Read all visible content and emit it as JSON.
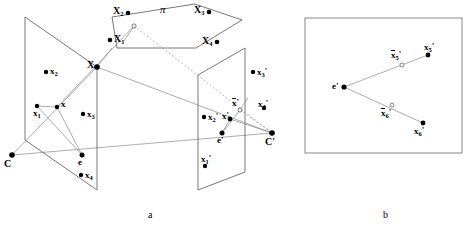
{
  "figure": {
    "panels": [
      {
        "id": "a",
        "label": "a",
        "x": 148,
        "y": 210
      },
      {
        "id": "b",
        "label": "b",
        "x": 383,
        "y": 210
      }
    ]
  },
  "panel_a": {
    "plane_pi": {
      "label": "π",
      "label_x": 160,
      "label_y": 8,
      "polygon": "112,17 195,4 242,20 196,48 117,48",
      "points": [
        {
          "name": "X2",
          "base": "X",
          "sub": "2",
          "prime": false,
          "bar": false,
          "cx": 128,
          "cy": 13,
          "filled": true,
          "label_x": 113,
          "label_y": 8,
          "label_dir": "left"
        },
        {
          "name": "X3",
          "base": "X",
          "sub": "3",
          "prime": false,
          "bar": false,
          "cx": 209,
          "cy": 12,
          "filled": true,
          "label_x": 194,
          "label_y": 7,
          "label_dir": "left"
        },
        {
          "name": "X1",
          "base": "X",
          "sub": "1",
          "prime": false,
          "bar": false,
          "cx": 110,
          "cy": 40,
          "filled": true,
          "label_x": 114,
          "label_y": 36,
          "label_dir": "right"
        },
        {
          "name": "X4",
          "base": "X",
          "sub": "4",
          "prime": false,
          "bar": false,
          "cx": 217,
          "cy": 42,
          "filled": true,
          "label_x": 202,
          "label_y": 37,
          "label_dir": "left"
        },
        {
          "name": "Xbar",
          "base": "X",
          "sub": "",
          "prime": false,
          "bar": true,
          "cx": 134,
          "cy": 26,
          "filled": false,
          "label_x": 0,
          "label_y": 0,
          "label_dir": "none"
        }
      ]
    },
    "left_plane": {
      "polygon": "25,17 97,67 97,190 25,140",
      "camera": {
        "name": "C",
        "label": "C",
        "cx": 12,
        "cy": 155,
        "label_x": 5,
        "label_y": 160
      },
      "epipole": {
        "name": "e",
        "label": "e",
        "cx": 82,
        "cy": 155,
        "label_x": 84,
        "label_y": 158
      },
      "points": [
        {
          "name": "x2",
          "base": "x",
          "sub": "2",
          "prime": false,
          "bar": false,
          "cx": 46,
          "cy": 72,
          "filled": true,
          "label_x": 50,
          "label_y": 70,
          "label_dir": "right"
        },
        {
          "name": "x1",
          "base": "x",
          "sub": "1",
          "prime": false,
          "bar": false,
          "cx": 37,
          "cy": 106,
          "filled": true,
          "label_x": 36,
          "label_y": 111,
          "label_dir": "right"
        },
        {
          "name": "x",
          "base": "x",
          "sub": "",
          "prime": false,
          "bar": false,
          "cx": 57,
          "cy": 107,
          "filled": true,
          "label_x": 61,
          "label_y": 103,
          "label_dir": "right"
        },
        {
          "name": "x3",
          "base": "x",
          "sub": "3",
          "prime": false,
          "bar": false,
          "cx": 83,
          "cy": 114,
          "filled": true,
          "label_x": 87,
          "label_y": 112,
          "label_dir": "right"
        },
        {
          "name": "x4",
          "base": "x",
          "sub": "4",
          "prime": false,
          "bar": false,
          "cx": 81,
          "cy": 175,
          "filled": true,
          "label_x": 85,
          "label_y": 173,
          "label_dir": "right"
        }
      ]
    },
    "right_plane": {
      "polygon": "198,75 245,48 245,172 198,190",
      "camera": {
        "name": "Cprime",
        "label": "C'",
        "cx": 272,
        "cy": 133,
        "label_x": 266,
        "label_y": 139
      },
      "epipole": {
        "name": "eprime",
        "label": "e'",
        "cx": 222,
        "cy": 133,
        "label_x": 224,
        "label_y": 136
      },
      "points": [
        {
          "name": "x3p",
          "base": "x",
          "sub": "3",
          "prime": true,
          "bar": false,
          "cx": 253,
          "cy": 72,
          "filled": true,
          "label_x": 257,
          "label_y": 70,
          "label_dir": "right"
        },
        {
          "name": "x4p",
          "base": "x",
          "sub": "4",
          "prime": true,
          "bar": false,
          "cx": 264,
          "cy": 108,
          "filled": true,
          "label_x": 261,
          "label_y": 102,
          "label_dir": "right"
        },
        {
          "name": "x2p",
          "base": "x",
          "sub": "2",
          "prime": true,
          "bar": false,
          "cx": 204,
          "cy": 117,
          "filled": true,
          "label_x": 208,
          "label_y": 115,
          "label_dir": "right"
        },
        {
          "name": "xp",
          "base": "x",
          "sub": "",
          "prime": true,
          "bar": false,
          "cx": 230,
          "cy": 119,
          "filled": true,
          "label_x": 224,
          "label_y": 115,
          "label_dir": "left"
        },
        {
          "name": "xbarp",
          "base": "x",
          "sub": "",
          "prime": true,
          "bar": true,
          "cx": 240,
          "cy": 110,
          "filled": false,
          "label_x": 233,
          "label_y": 101,
          "label_dir": "right"
        },
        {
          "name": "x1p",
          "base": "x",
          "sub": "1",
          "prime": true,
          "bar": false,
          "cx": 205,
          "cy": 166,
          "filled": true,
          "label_x": 202,
          "label_y": 157,
          "label_dir": "right"
        }
      ]
    },
    "world_point": {
      "name": "X",
      "label": "X",
      "cx": 97,
      "cy": 67,
      "label_x": 88,
      "label_y": 62
    },
    "rays": [
      {
        "from": "C",
        "to": "X",
        "kind": "solid"
      },
      {
        "from": "X",
        "to": "Cprime",
        "kind": "solid"
      },
      {
        "from": "Xbar",
        "to": "Cprime",
        "kind": "dashed"
      },
      {
        "from": "C",
        "to": "e",
        "kind": "baseline"
      }
    ]
  },
  "panel_b": {
    "frame": {
      "x": 305,
      "y": 18,
      "w": 157,
      "h": 135
    },
    "epipole": {
      "name": "eprime",
      "label": "e'",
      "cx": 344,
      "cy": 87,
      "label_x": 334,
      "label_y": 85
    },
    "points": [
      {
        "name": "x5p",
        "base": "x",
        "sub": "5",
        "prime": true,
        "bar": false,
        "cx": 428,
        "cy": 55,
        "filled": true,
        "label_x": 424,
        "label_y": 44,
        "label_dir": "right"
      },
      {
        "name": "xbar5p",
        "base": "x",
        "sub": "5",
        "prime": true,
        "bar": true,
        "cx": 402,
        "cy": 65,
        "filled": false,
        "label_x": 392,
        "label_y": 52,
        "label_dir": "right"
      },
      {
        "name": "xbar6p",
        "base": "x",
        "sub": "6",
        "prime": true,
        "bar": true,
        "cx": 392,
        "cy": 105,
        "filled": false,
        "label_x": 382,
        "label_y": 110,
        "label_dir": "right"
      },
      {
        "name": "x6p",
        "base": "x",
        "sub": "6",
        "prime": true,
        "bar": false,
        "cx": 423,
        "cy": 123,
        "filled": true,
        "label_x": 415,
        "label_y": 128,
        "label_dir": "right"
      }
    ],
    "rays": [
      {
        "from": "eprime",
        "to": "x5p",
        "kind": "solid"
      },
      {
        "from": "eprime",
        "to": "x6p",
        "kind": "solid"
      }
    ]
  },
  "colors": {
    "stroke": "#555555",
    "frame": "#888888",
    "point": "#000000",
    "open_point_fill": "#ffffff",
    "background": "#ffffff"
  }
}
